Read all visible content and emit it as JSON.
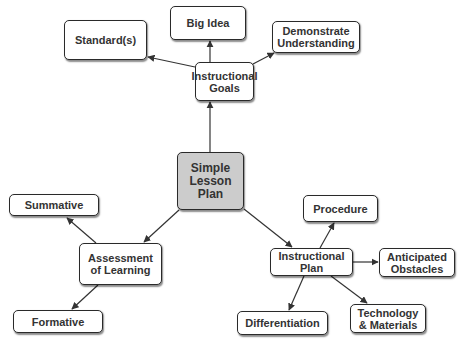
{
  "diagram": {
    "title": "Simple Lesson Plan",
    "colors": {
      "edge": "#333333",
      "border": "#2a2a2a",
      "center_fill": "#cccccc",
      "node_fill": "#ffffff",
      "text": "#333333"
    },
    "nodes": [
      {
        "id": "center",
        "label": "Simple\nLesson\nPlan",
        "x": 177,
        "y": 152,
        "w": 67,
        "h": 58,
        "center": true
      },
      {
        "id": "goals",
        "label": "Instructional\nGoals",
        "x": 195,
        "y": 62,
        "w": 59,
        "h": 39
      },
      {
        "id": "standards",
        "label": "Standard(s)",
        "x": 64,
        "y": 20,
        "w": 83,
        "h": 40
      },
      {
        "id": "bigidea",
        "label": "Big Idea",
        "x": 170,
        "y": 6,
        "w": 76,
        "h": 34
      },
      {
        "id": "demonstrate",
        "label": "Demonstrate\nUnderstanding",
        "x": 272,
        "y": 21,
        "w": 88,
        "h": 32
      },
      {
        "id": "assessment",
        "label": "Assessment\nof Learning",
        "x": 79,
        "y": 243,
        "w": 83,
        "h": 42
      },
      {
        "id": "summative",
        "label": "Summative",
        "x": 9,
        "y": 194,
        "w": 90,
        "h": 22
      },
      {
        "id": "formative",
        "label": "Formative",
        "x": 13,
        "y": 310,
        "w": 90,
        "h": 23
      },
      {
        "id": "plan",
        "label": "Instructional\nPlan",
        "x": 270,
        "y": 248,
        "w": 83,
        "h": 28
      },
      {
        "id": "procedure",
        "label": "Procedure",
        "x": 303,
        "y": 195,
        "w": 75,
        "h": 27
      },
      {
        "id": "obstacles",
        "label": "Anticipated\nObstacles",
        "x": 379,
        "y": 248,
        "w": 76,
        "h": 29
      },
      {
        "id": "differentiation",
        "label": "Differentiation",
        "x": 237,
        "y": 311,
        "w": 91,
        "h": 24
      },
      {
        "id": "technology",
        "label": "Technology\n& Materials",
        "x": 350,
        "y": 304,
        "w": 76,
        "h": 29
      }
    ],
    "edges": [
      {
        "from": "center",
        "to": "goals",
        "x1": 210,
        "y1": 152,
        "x2": 210,
        "y2": 102
      },
      {
        "from": "goals",
        "to": "bigidea",
        "x1": 210,
        "y1": 62,
        "x2": 210,
        "y2": 41
      },
      {
        "from": "goals",
        "to": "standards",
        "x1": 195,
        "y1": 67,
        "x2": 148,
        "y2": 57
      },
      {
        "from": "goals",
        "to": "demonstrate",
        "x1": 253,
        "y1": 64,
        "x2": 274,
        "y2": 53
      },
      {
        "from": "center",
        "to": "assessment",
        "x1": 179,
        "y1": 210,
        "x2": 144,
        "y2": 242
      },
      {
        "from": "assessment",
        "to": "summative",
        "x1": 96,
        "y1": 243,
        "x2": 67,
        "y2": 218
      },
      {
        "from": "assessment",
        "to": "formative",
        "x1": 98,
        "y1": 285,
        "x2": 72,
        "y2": 309
      },
      {
        "from": "center",
        "to": "plan",
        "x1": 244,
        "y1": 209,
        "x2": 292,
        "y2": 247
      },
      {
        "from": "plan",
        "to": "procedure",
        "x1": 320,
        "y1": 248,
        "x2": 334,
        "y2": 223
      },
      {
        "from": "plan",
        "to": "obstacles",
        "x1": 353,
        "y1": 262,
        "x2": 378,
        "y2": 262
      },
      {
        "from": "plan",
        "to": "differentiation",
        "x1": 304,
        "y1": 276,
        "x2": 289,
        "y2": 310
      },
      {
        "from": "plan",
        "to": "technology",
        "x1": 331,
        "y1": 276,
        "x2": 367,
        "y2": 303
      }
    ]
  }
}
